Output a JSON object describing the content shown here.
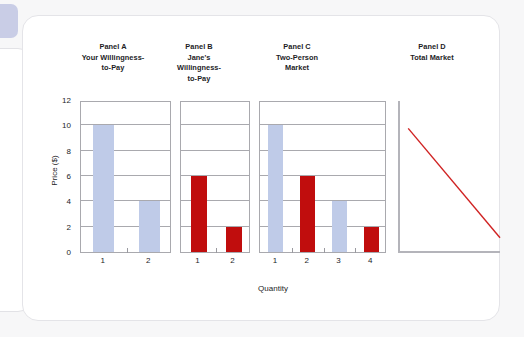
{
  "figure": {
    "panel_titles": {
      "a": [
        "Panel A",
        "Your Willingness-",
        "to-Pay"
      ],
      "b": [
        "Panel B",
        "Jane's",
        "Willingness-",
        "to-Pay"
      ],
      "c": [
        "Panel C",
        "Two-Person",
        "Market"
      ],
      "d": [
        "Panel D",
        "Total Market"
      ]
    },
    "y_axis_label": "Price ($)",
    "x_axis_label": "Quantity",
    "y_ticks": [
      "0",
      "2",
      "4",
      "6",
      "8",
      "10",
      "12"
    ],
    "colors": {
      "blue_bar": "#bfcbe8",
      "red_bar": "#c00d0d",
      "axis": "#a9a9ae",
      "demand_line": "#d02222",
      "text": "#1d1d1f",
      "card_background": "#ffffff",
      "page_background": "#f7f7f8"
    }
  },
  "chart_data": [
    {
      "type": "bar",
      "title": "Panel A Your Willingness-to-Pay",
      "xlabel": "Quantity",
      "ylabel": "Price ($)",
      "ylim": [
        0,
        12
      ],
      "yticks": [
        0,
        2,
        4,
        6,
        8,
        10,
        12
      ],
      "grid": true,
      "legend": "none",
      "categories": [
        "1",
        "2"
      ],
      "values": [
        10,
        4
      ],
      "bar_colors": [
        "#bfcbe8",
        "#bfcbe8"
      ]
    },
    {
      "type": "bar",
      "title": "Panel B Jane's Willingness-to-Pay",
      "xlabel": "Quantity",
      "ylabel": "Price ($)",
      "ylim": [
        0,
        12
      ],
      "yticks": [
        0,
        2,
        4,
        6,
        8,
        10,
        12
      ],
      "grid": true,
      "legend": "none",
      "categories": [
        "1",
        "2"
      ],
      "values": [
        6,
        2
      ],
      "bar_colors": [
        "#c00d0d",
        "#c00d0d"
      ]
    },
    {
      "type": "bar",
      "title": "Panel C Two-Person Market",
      "xlabel": "Quantity",
      "ylabel": "Price ($)",
      "ylim": [
        0,
        12
      ],
      "yticks": [
        0,
        2,
        4,
        6,
        8,
        10,
        12
      ],
      "grid": true,
      "legend": "none",
      "categories": [
        "1",
        "2",
        "3",
        "4"
      ],
      "values": [
        10,
        6,
        4,
        2
      ],
      "bar_colors": [
        "#bfcbe8",
        "#c00d0d",
        "#bfcbe8",
        "#c00d0d"
      ]
    },
    {
      "type": "line",
      "title": "Panel D Total Market",
      "xlabel": "Quantity",
      "ylabel": "Price ($)",
      "grid": false,
      "legend": "none",
      "series": [
        {
          "name": "Market demand",
          "color": "#d02222",
          "x": [
            0.1,
            1.0
          ],
          "y": [
            0.82,
            0.1
          ]
        }
      ]
    }
  ]
}
